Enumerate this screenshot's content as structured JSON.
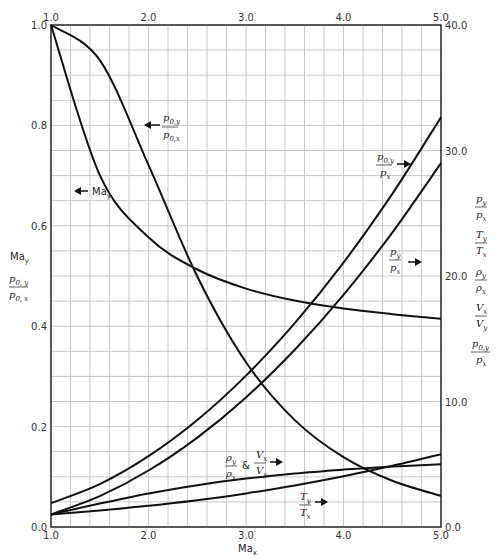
{
  "chart_data": {
    "type": "line",
    "title": "",
    "xlabel": "Ma_x",
    "ylabel_left": [
      "Ma_y",
      "p0,y / p0,x"
    ],
    "ylabel_right": [
      "p_y / p_x",
      "T_y / T_x",
      "ρ_y / ρ_x",
      "V_x / V_y",
      "p0,y / p_x"
    ],
    "xlim": [
      1.0,
      5.0
    ],
    "ylim_left": [
      0.0,
      1.0
    ],
    "ylim_right": [
      0.0,
      40.0
    ],
    "x_ticks": [
      "1.0",
      "2.0",
      "3.0",
      "4.0",
      "5.0"
    ],
    "y_ticks_left": [
      "0.0",
      "0.2",
      "0.4",
      "0.6",
      "0.8",
      "1.0"
    ],
    "y_ticks_right": [
      "0.0",
      "10.0",
      "20.0",
      "30.0",
      "40.0"
    ],
    "grid": true,
    "x": [
      1.0,
      1.5,
      2.0,
      2.5,
      3.0,
      3.5,
      4.0,
      4.5,
      5.0
    ],
    "series": [
      {
        "name": "Ma_y",
        "axis": "left",
        "values": [
          1.0,
          0.701,
          0.577,
          0.513,
          0.475,
          0.451,
          0.435,
          0.424,
          0.415
        ]
      },
      {
        "name": "p0,y/p0,x",
        "axis": "left",
        "values": [
          1.0,
          0.93,
          0.721,
          0.499,
          0.328,
          0.213,
          0.139,
          0.092,
          0.062
        ]
      },
      {
        "name": "p0,y/p_x",
        "axis": "right",
        "values": [
          1.893,
          3.413,
          5.641,
          8.526,
          12.06,
          16.24,
          21.07,
          26.54,
          32.65
        ]
      },
      {
        "name": "p_y/p_x",
        "axis": "right",
        "values": [
          1.0,
          2.458,
          4.5,
          7.125,
          10.33,
          14.13,
          18.5,
          23.46,
          29.0
        ]
      },
      {
        "name": "ρ_y/ρ_x & V_x/V_y",
        "axis": "right",
        "values": [
          1.0,
          1.862,
          2.667,
          3.333,
          3.857,
          4.261,
          4.571,
          4.812,
          5.0
        ]
      },
      {
        "name": "T_y/T_x",
        "axis": "right",
        "values": [
          1.0,
          1.32,
          1.688,
          2.138,
          2.679,
          3.315,
          4.047,
          4.875,
          5.8
        ]
      }
    ],
    "annotations": [
      {
        "text": "p0,y/p0,x",
        "arrow": "left"
      },
      {
        "text": "Ma_y",
        "arrow": "left"
      },
      {
        "text": "p0,y/p_x",
        "arrow": "right"
      },
      {
        "text": "p_y/p_x",
        "arrow": "right"
      },
      {
        "text": "ρ_y/ρ_x & V_x/V_y",
        "arrow": "right"
      },
      {
        "text": "T_y/T_x",
        "arrow": "right"
      }
    ]
  },
  "labels": {
    "xlabel_main": "Ma",
    "xlabel_sub": "x",
    "may_main": "Ma",
    "may_sub": "y",
    "amp": "&"
  }
}
